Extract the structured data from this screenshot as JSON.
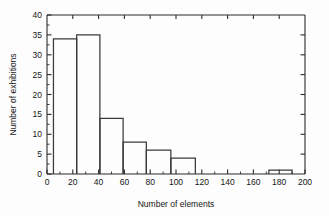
{
  "chart_data": {
    "type": "bar",
    "title": "",
    "subtitle": "",
    "xlabel": "Number of elements",
    "ylabel": "Number of exhibitions",
    "xlim": [
      0,
      200
    ],
    "ylim": [
      0,
      40
    ],
    "xticks": [
      0,
      20,
      40,
      60,
      80,
      100,
      120,
      140,
      160,
      180,
      200
    ],
    "xtick_labels": [
      "0",
      "20",
      "40",
      "60",
      "80",
      "100",
      "120",
      "140",
      "160",
      "180",
      "200"
    ],
    "xtick_minor_step": 10,
    "yticks": [
      0,
      5,
      10,
      15,
      20,
      25,
      30,
      35,
      40
    ],
    "ytick_labels": [
      "0",
      "5",
      "10",
      "15",
      "20",
      "25",
      "30",
      "35",
      "40"
    ],
    "ytick_minor_step": 2.5,
    "grid": false,
    "legend": null,
    "bin_edges": [
      5,
      23,
      41,
      59,
      77,
      96,
      115,
      172,
      190
    ],
    "bars": [
      {
        "x0": 5,
        "x1": 23,
        "value": 34
      },
      {
        "x0": 23,
        "x1": 41,
        "value": 35
      },
      {
        "x0": 41,
        "x1": 59,
        "value": 14
      },
      {
        "x0": 59,
        "x1": 77,
        "value": 8
      },
      {
        "x0": 77,
        "x1": 96,
        "value": 6
      },
      {
        "x0": 96,
        "x1": 115,
        "value": 4
      },
      {
        "x0": 172,
        "x1": 190,
        "value": 1
      }
    ],
    "categories": [
      "5-23",
      "23-41",
      "41-59",
      "59-77",
      "77-96",
      "96-115",
      "172-190"
    ],
    "values": [
      34,
      35,
      14,
      8,
      6,
      4,
      1
    ],
    "colors": {
      "bar_stroke": "#3a3a3a",
      "bar_fill": "none",
      "axis": "#2b2b2b",
      "text": "#161616",
      "background": "#fdfdfd"
    }
  }
}
